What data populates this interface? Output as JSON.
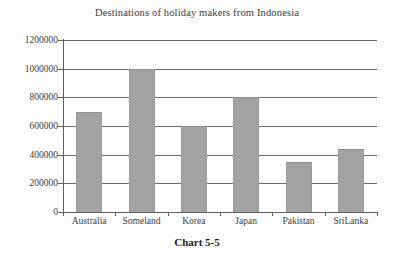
{
  "chart_data": {
    "type": "bar",
    "title": "Destinations of holiday makers from Indonesia",
    "caption": "Chart 5-5",
    "categories": [
      "Australia",
      "Someland",
      "Korea",
      "Japan",
      "Pakistan",
      "SriLanka"
    ],
    "values": [
      700000,
      1000000,
      600000,
      800000,
      350000,
      440000
    ],
    "xlabel": "",
    "ylabel": "",
    "ylim": [
      0,
      1200000
    ],
    "ytick_labels": [
      "0",
      "200000",
      "400000",
      "600000",
      "800000",
      "1000000",
      "1200000"
    ],
    "ytick_values": [
      0,
      200000,
      400000,
      600000,
      800000,
      1000000,
      1200000
    ],
    "grid": true,
    "legend": false,
    "bar_color": "#a3a3a3",
    "axis_color": "#5f5f5f",
    "grid_color": "#6e6e6e",
    "text_color": "#3c3c3c"
  }
}
